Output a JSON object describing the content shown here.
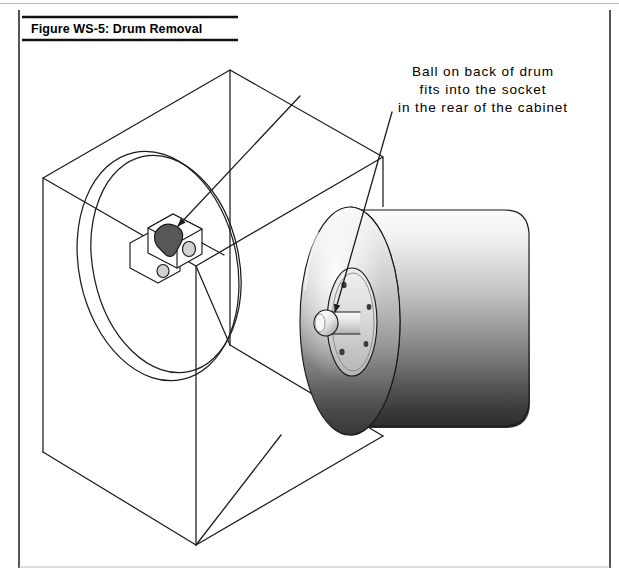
{
  "page": {
    "width": 619,
    "height": 577,
    "background_color": "#ffffff",
    "border_color": "#2b2b2b"
  },
  "figure": {
    "title": "Figure WS-5: Drum Removal",
    "title_rule_color": "#111111",
    "annotation": {
      "line1": "Ball on back of drum",
      "line2": "fits into the socket",
      "line3": "in the rear of the cabinet"
    },
    "callouts": [
      {
        "target": "socket-in-cabinet-rear",
        "label": "socket bracket"
      },
      {
        "target": "ball-on-drum-hub",
        "label": "drum hub ball"
      }
    ],
    "parts": {
      "cabinet": {
        "name": "cabinet",
        "style": "isometric wireframe box with circular drum opening"
      },
      "socket": {
        "name": "socket bracket",
        "cavity_color": "#575757",
        "body_color": "#ffffff",
        "bolt_holes": 2
      },
      "drum": {
        "name": "drum",
        "shading": "vertical gradient light to dark",
        "top_color": "#fdfdfd",
        "bottom_color": "#2e2e2e",
        "face_highlight_color": "#f6f6f6"
      },
      "hub": {
        "name": "drum hub plate",
        "bolt_holes": 4,
        "shaft_color": "#e8e8e8",
        "ball_color": "#f2f2f2"
      }
    }
  }
}
